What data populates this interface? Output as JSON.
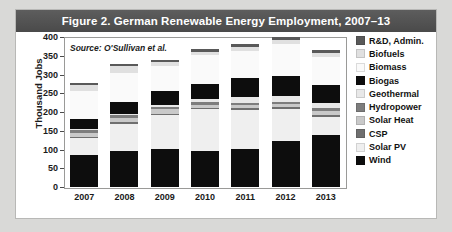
{
  "figure": {
    "title": "Figure 2. German Renewable Energy Employment, 2007–13",
    "source_note": "Source: O'Sullivan et al."
  },
  "chart_data": {
    "type": "bar",
    "stacked": true,
    "title": "Figure 2. German Renewable Energy Employment, 2007–13",
    "subtitle": "Source: O'Sullivan et al.",
    "xlabel": "",
    "ylabel": "Thousand Jobs",
    "ylim": [
      0,
      400
    ],
    "yticks": [
      0,
      50,
      100,
      150,
      200,
      250,
      300,
      350,
      400
    ],
    "grid": false,
    "legend_position": "right",
    "categories": [
      "2007",
      "2008",
      "2009",
      "2010",
      "2011",
      "2012",
      "2013"
    ],
    "series": [
      {
        "name": "Wind",
        "color": "#0d0d0d",
        "values": [
          86,
          96,
          102,
          96,
          101,
          122,
          138
        ]
      },
      {
        "name": "Solar PV",
        "color": "#efefef",
        "values": [
          44,
          72,
          89,
          112,
          105,
          86,
          50
        ]
      },
      {
        "name": "CSP",
        "color": "#6f6f6f",
        "values": [
          4,
          5,
          5,
          4,
          4,
          5,
          5
        ]
      },
      {
        "name": "Solar Heat",
        "color": "#c9c9c9",
        "values": [
          10,
          11,
          11,
          8,
          8,
          8,
          10
        ]
      },
      {
        "name": "Hydropower",
        "color": "#7d7d7d",
        "values": [
          7,
          7,
          7,
          7,
          7,
          7,
          7
        ]
      },
      {
        "name": "Geothermal",
        "color": "#e8e8e8",
        "values": [
          4,
          5,
          6,
          8,
          14,
          14,
          15
        ]
      },
      {
        "name": "Biogas",
        "color": "#0d0d0d",
        "values": [
          26,
          32,
          36,
          40,
          52,
          55,
          47
        ]
      },
      {
        "name": "Biomass",
        "color": "#fafafa",
        "values": [
          74,
          77,
          66,
          76,
          73,
          85,
          76
        ]
      },
      {
        "name": "Biofuels",
        "color": "#e0e0e0",
        "values": [
          18,
          17,
          11,
          10,
          10,
          10,
          10
        ]
      },
      {
        "name": "R&D, Admin.",
        "color": "#595959",
        "values": [
          4,
          7,
          6,
          7,
          8,
          8,
          7
        ]
      }
    ],
    "totals": [
      277,
      322,
      339,
      368,
      382,
      400,
      365
    ]
  },
  "legend": {
    "items": [
      {
        "label": "R&D, Admin.",
        "color": "#595959"
      },
      {
        "label": "Biofuels",
        "color": "#e0e0e0"
      },
      {
        "label": "Biomass",
        "color": "#fafafa"
      },
      {
        "label": "Biogas",
        "color": "#0d0d0d"
      },
      {
        "label": "Geothermal",
        "color": "#e8e8e8"
      },
      {
        "label": "Hydropower",
        "color": "#7d7d7d"
      },
      {
        "label": "Solar Heat",
        "color": "#c9c9c9"
      },
      {
        "label": "CSP",
        "color": "#6f6f6f"
      },
      {
        "label": "Solar PV",
        "color": "#efefef"
      },
      {
        "label": "Wind",
        "color": "#0d0d0d"
      }
    ]
  }
}
